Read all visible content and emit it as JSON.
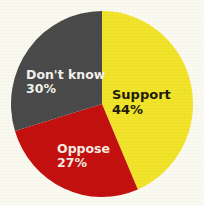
{
  "background_color": "#fbfaf0",
  "chart_data": {
    "type": "pie",
    "title": "",
    "subtitle": "",
    "xlabel": "",
    "ylabel": "",
    "legend_position": "none",
    "grid": false,
    "labels_inside_slices": true,
    "start_angle_deg": 0,
    "direction": "clockwise",
    "categories": [
      "Support",
      "Oppose",
      "Don't know"
    ],
    "values": [
      44,
      27,
      30
    ],
    "value_suffix": "%",
    "colors": [
      "#f2e42a",
      "#c41110",
      "#4a4a4a"
    ],
    "slices": [
      {
        "name": "Support",
        "value": 44,
        "value_label": "44%",
        "color": "#f2e42a",
        "label_color": "#201c08",
        "start_deg": 0,
        "end_deg": 158.4
      },
      {
        "name": "Oppose",
        "value": 27,
        "value_label": "27%",
        "color": "#c41110",
        "label_color": "#f6ece2",
        "start_deg": 158.4,
        "end_deg": 255.6
      },
      {
        "name": "Don't know",
        "value": 30,
        "value_label": "30%",
        "color": "#4a4a4a",
        "label_color": "#f3f2ec",
        "start_deg": 255.6,
        "end_deg": 360
      }
    ]
  }
}
